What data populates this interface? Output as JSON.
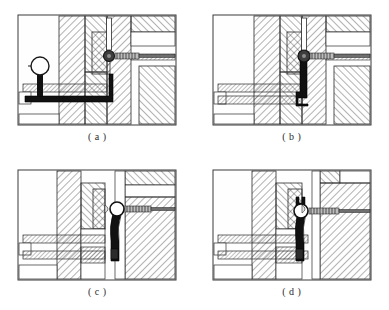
{
  "document": {
    "type": "engineering-drawing",
    "title": "Clamping mechanism cross-sections",
    "panel_count": 4,
    "background_color": "#ffffff",
    "line_color": "#1a1a1a",
    "hatch_color": "#4a4a4a",
    "solid_part_color": "#111111",
    "body_fill_color": "#fdfdfd"
  },
  "panels": [
    {
      "id": "a",
      "caption": "( a )",
      "state_label": "lever lowered - ball handle at left",
      "parts": {
        "ball_handle": "ball-handle",
        "lever_arm": "lever-arm-horizontal",
        "pivot_pin": "pivot-pin-dark",
        "screw_assembly": "threaded-screw-right",
        "guide_rod": "guide-rod-left"
      }
    },
    {
      "id": "b",
      "caption": "( b )",
      "state_label": "lever vertical - engaged at pivot",
      "parts": {
        "lever_arm": "lever-arm-vertical",
        "pivot_pin": "pivot-pin-dark",
        "screw_assembly": "threaded-screw-right",
        "vertical_rod": "vertical-rod-top",
        "guide_rod": "guide-rod-left"
      }
    },
    {
      "id": "c",
      "caption": "( c )",
      "state_label": "pivot open - lever seated against block",
      "parts": {
        "pivot_pin": "pivot-pin-open",
        "lever_arm": "lever-arm-curved",
        "screw_assembly": "threaded-screw-right",
        "guide_rod": "guide-rod-left"
      }
    },
    {
      "id": "d",
      "caption": "( d )",
      "state_label": "lever swung clear - fork head visible",
      "parts": {
        "pivot_pin": "pivot-pin-open",
        "fork_head": "fork-claw-head",
        "lever_arm": "lever-arm-curved",
        "screw_assembly": "threaded-screw-right",
        "guide_rod": "guide-rod-left"
      }
    }
  ]
}
